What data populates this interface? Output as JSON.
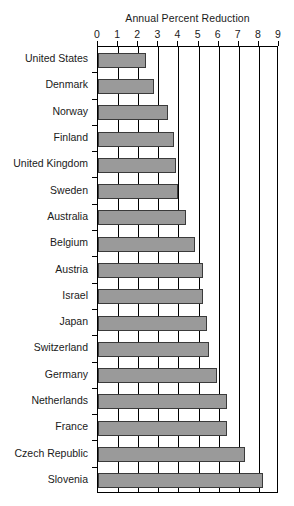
{
  "chart_data": {
    "type": "bar",
    "orientation": "horizontal",
    "title": "Annual Percent Reduction",
    "xlabel": "",
    "ylabel": "",
    "xlim": [
      0,
      9
    ],
    "xticks": [
      0,
      1,
      2,
      3,
      4,
      5,
      6,
      7,
      8,
      9
    ],
    "grid": true,
    "legend": null,
    "categories": [
      "United States",
      "Denmark",
      "Norway",
      "Finland",
      "United Kingdom",
      "Sweden",
      "Australia",
      "Belgium",
      "Austria",
      "Israel",
      "Japan",
      "Switzerland",
      "Germany",
      "Netherlands",
      "France",
      "Czech Republic",
      "Slovenia"
    ],
    "values": [
      2.4,
      2.8,
      3.5,
      3.8,
      3.9,
      4.0,
      4.4,
      4.8,
      5.2,
      5.2,
      5.4,
      5.5,
      5.9,
      6.4,
      6.4,
      7.3,
      8.2
    ],
    "colors": {
      "bar_fill": "#9a9a9a",
      "bar_border": "#3a3a3a",
      "axis": "#000000",
      "text": "#1a1a1a",
      "background": "#ffffff"
    }
  }
}
